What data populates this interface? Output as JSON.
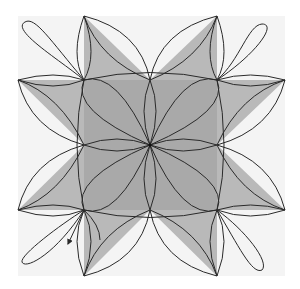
{
  "figure": {
    "type": "geometric-curve-diagram",
    "colors": {
      "background": "#ffffff",
      "outer_square": "#f4f4f4",
      "center_square": "#a9a9a9",
      "triangle": "#b9b9b9",
      "stroke": "#2a2a2a"
    },
    "center": [
      150,
      145
    ],
    "inner_square": {
      "x1": 84,
      "y1": 80,
      "x2": 217,
      "y2": 210
    },
    "outer_tips": {
      "top_left": [
        84,
        16
      ],
      "top_right": [
        217,
        16
      ],
      "left_top": [
        18,
        80
      ],
      "right_top": [
        285,
        80
      ],
      "left_bottom": [
        18,
        210
      ],
      "right_bottom": [
        285,
        210
      ],
      "bottom_left": [
        84,
        276
      ],
      "bottom_right": [
        217,
        276
      ]
    },
    "arrow": {
      "from": [
        84,
        210
      ],
      "to": [
        66,
        246
      ],
      "direction": "down-left"
    }
  }
}
